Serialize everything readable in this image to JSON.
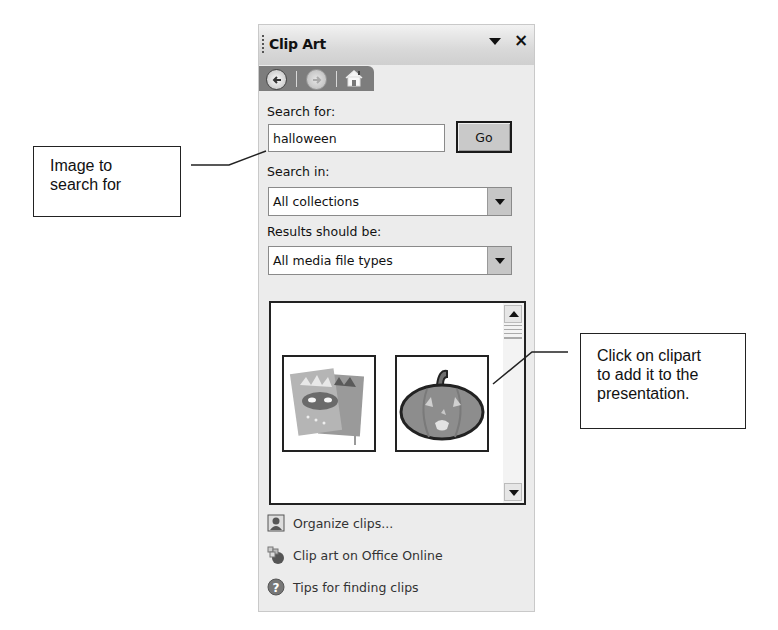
{
  "pane": {
    "title": "Clip Art",
    "menu_icon": "dropdown-arrow",
    "close_label": "×",
    "nav": {
      "back_icon": "back-arrow-icon",
      "forward_icon": "forward-arrow-icon",
      "home_icon": "home-icon"
    },
    "search_label": "Search for:",
    "search_value": "halloween",
    "go_label": "Go",
    "search_in_label": "Search in:",
    "search_in_value": "All collections",
    "results_label": "Results should be:",
    "results_value": "All media file types",
    "results": [
      {
        "name": "halloween masks clipart",
        "icon": "masks-clipart"
      },
      {
        "name": "jack-o-lantern pumpkin clipart",
        "icon": "pumpkin-clipart"
      }
    ],
    "tasks": [
      {
        "label": "Organize clips...",
        "icon": "organize-clips-icon"
      },
      {
        "label": "Clip art on Office Online",
        "icon": "office-online-icon"
      },
      {
        "label": "Tips for finding clips",
        "icon": "help-icon"
      }
    ]
  },
  "callouts": {
    "search": {
      "line1": "Image to",
      "line2": "search for"
    },
    "click": {
      "line1": "Click on clipart",
      "line2": "to add it to the",
      "line3": "presentation."
    }
  }
}
